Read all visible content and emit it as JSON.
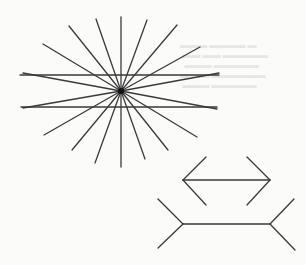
{
  "figure": {
    "colors": {
      "background": "#fbfbfa",
      "line": "#3a3a3a",
      "center_dot": "#111111"
    },
    "hering_illusion": {
      "name": "hering-illusion",
      "center": [
        121,
        91
      ],
      "center_dot_radius": 3,
      "parallel_lines": [
        {
          "x1": 20,
          "y1": 75,
          "x2": 219,
          "y2": 75
        },
        {
          "x1": 21,
          "y1": 107,
          "x2": 217,
          "y2": 107
        }
      ],
      "ray_endpoints": [
        [
          121,
          17
        ],
        [
          147,
          20
        ],
        [
          177,
          25
        ],
        [
          200,
          47
        ],
        [
          219,
          73
        ],
        [
          217,
          109
        ],
        [
          197,
          137
        ],
        [
          168,
          150
        ],
        [
          145,
          159
        ],
        [
          121,
          167
        ],
        [
          95,
          163
        ],
        [
          72,
          150
        ],
        [
          44,
          135
        ],
        [
          23,
          108
        ],
        [
          23,
          73
        ],
        [
          43,
          44
        ],
        [
          69,
          26
        ],
        [
          96,
          19
        ]
      ]
    },
    "muller_lyer_illusion": {
      "name": "muller-lyer-illusion",
      "arrows_inward": {
        "shaft": {
          "x1": 183,
          "y1": 180,
          "x2": 270,
          "y2": 180
        },
        "fins": [
          {
            "x1": 183,
            "y1": 180,
            "x2": 206,
            "y2": 157
          },
          {
            "x1": 183,
            "y1": 180,
            "x2": 206,
            "y2": 205
          },
          {
            "x1": 270,
            "y1": 180,
            "x2": 247,
            "y2": 157
          },
          {
            "x1": 270,
            "y1": 180,
            "x2": 247,
            "y2": 205
          }
        ]
      },
      "arrows_outward": {
        "shaft": {
          "x1": 183,
          "y1": 224,
          "x2": 270,
          "y2": 224
        },
        "fins": [
          {
            "x1": 183,
            "y1": 224,
            "x2": 158,
            "y2": 199
          },
          {
            "x1": 183,
            "y1": 224,
            "x2": 158,
            "y2": 248
          },
          {
            "x1": 270,
            "y1": 224,
            "x2": 294,
            "y2": 199
          },
          {
            "x1": 270,
            "y1": 224,
            "x2": 295,
            "y2": 250
          }
        ]
      }
    }
  }
}
